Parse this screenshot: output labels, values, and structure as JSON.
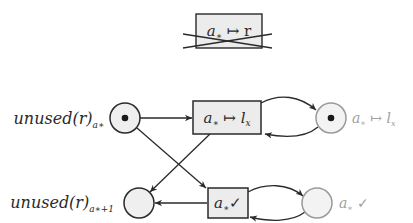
{
  "diagram": {
    "type": "petri-net",
    "disabled_transition": {
      "label_main": "a",
      "label_sub": "∗",
      "label_rest": " ↦ r",
      "crossed_out": true
    },
    "places": [
      {
        "id": "p1",
        "label_main": "unused(r)",
        "label_sub": "a∗",
        "tokens": 1,
        "label_side": "left",
        "style": "dark"
      },
      {
        "id": "p2",
        "label_main": "a",
        "label_sub": "∗",
        "label_rest": " ↦ l",
        "label_rest_sub": "x",
        "tokens": 1,
        "label_side": "right",
        "style": "faded"
      },
      {
        "id": "p3",
        "label_main": "unused(r)",
        "label_sub": "a∗+1",
        "tokens": 0,
        "label_side": "left",
        "style": "dark"
      },
      {
        "id": "p4",
        "label_main": "a",
        "label_sub": "∗",
        "label_rest": " ✓",
        "tokens": 0,
        "label_side": "right",
        "style": "faded"
      }
    ],
    "transitions": [
      {
        "id": "t1",
        "label_main": "a",
        "label_sub": "∗",
        "label_rest": " ↦ l",
        "label_rest_sub": "x"
      },
      {
        "id": "t2",
        "label_main": "a",
        "label_sub": "∗",
        "label_rest": "✓"
      }
    ],
    "arcs": [
      {
        "from": "p1",
        "to": "t1"
      },
      {
        "from": "p1",
        "to": "t2"
      },
      {
        "from": "t1",
        "to": "p2"
      },
      {
        "from": "p2",
        "to": "t1"
      },
      {
        "from": "t1",
        "to": "p3"
      },
      {
        "from": "t2",
        "to": "p3"
      },
      {
        "from": "t2",
        "to": "p4"
      },
      {
        "from": "p4",
        "to": "t2"
      }
    ],
    "colors": {
      "stroke": "#2a2a2a",
      "place_fill": "#efefef",
      "transition_fill": "#ececec",
      "faded_stroke": "#9a9a9a",
      "faded_text": "#a0a0a0",
      "text": "#2a2a2a"
    }
  }
}
